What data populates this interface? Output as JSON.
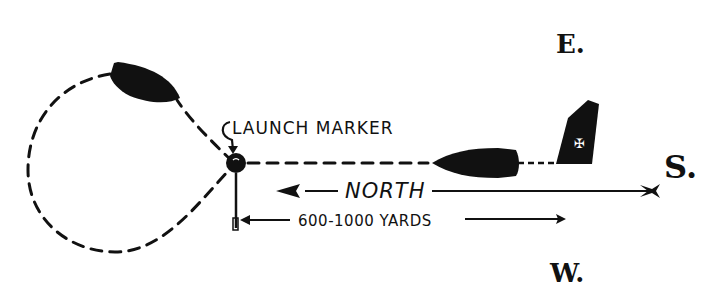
{
  "diagram": {
    "compass": {
      "east": "E.",
      "west": "W.",
      "south": "S."
    },
    "labels": {
      "launch_marker": "LAUNCH MARKER",
      "north": "NORTH",
      "distance": "600-1000 YARDS"
    },
    "elements": {
      "boat_loop": "boat-on-turning-loop",
      "boat_approach": "boat-on-approach",
      "target_sail": "sail-target",
      "marker_buoy": "launch-marker-buoy",
      "north_arrow": "arrow pointing north",
      "distance_arrow": "double-ended distance arrow"
    },
    "colors": {
      "ink": "#111111",
      "paper": "#ffffff"
    }
  }
}
